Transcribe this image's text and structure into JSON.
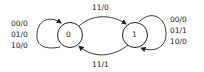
{
  "diagram": {
    "type": "state-machine",
    "states": [
      {
        "id": "s0",
        "label": "0"
      },
      {
        "id": "s1",
        "label": "1"
      }
    ],
    "transitions": [
      {
        "from": "0",
        "to": "0",
        "labels": [
          "00/0",
          "01/0",
          "10/0"
        ]
      },
      {
        "from": "0",
        "to": "1",
        "label": "11/0"
      },
      {
        "from": "1",
        "to": "0",
        "label": "11/1"
      },
      {
        "from": "1",
        "to": "1",
        "labels": [
          "00/0",
          "01/1",
          "10/0"
        ]
      }
    ],
    "left_loop": {
      "l1": "00/0",
      "l2": "01/0",
      "l3": "10/0"
    },
    "right_loop": {
      "l1": "00/0",
      "l2": "01/1",
      "l3": "10/0"
    },
    "top_edge": "11/0",
    "bottom_edge": "11/1",
    "state0": "0",
    "state1": "1"
  }
}
